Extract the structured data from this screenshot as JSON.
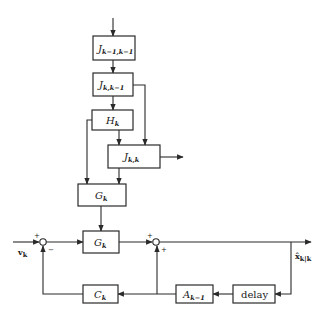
{
  "diagram": {
    "type": "block-diagram",
    "blocks": {
      "j_prev_prev": {
        "main": "J",
        "sub": "k−1,k−1"
      },
      "j_k_prev": {
        "main": "J",
        "sub": "k,k−1"
      },
      "h_k": {
        "main": "H",
        "sub": "k"
      },
      "j_k_k": {
        "main": "J",
        "sub": "k,k"
      },
      "g_k_upper": {
        "main": "G",
        "sub": "k"
      },
      "g_k_lower": {
        "main": "G",
        "sub": "k"
      },
      "c_k": {
        "main": "C",
        "sub": "k"
      },
      "a_k_prev": {
        "main": "A",
        "sub": "k−1"
      },
      "delay": {
        "main": "delay",
        "sub": ""
      }
    },
    "signals": {
      "input": {
        "main": "v",
        "sub": "k"
      },
      "output": {
        "main": "x̂",
        "sub": "k|k"
      }
    },
    "junctions": {
      "left": {
        "top_sign": "+",
        "bottom_sign": "−"
      },
      "right": {
        "top_sign": "+",
        "bottom_sign": "+"
      }
    }
  }
}
